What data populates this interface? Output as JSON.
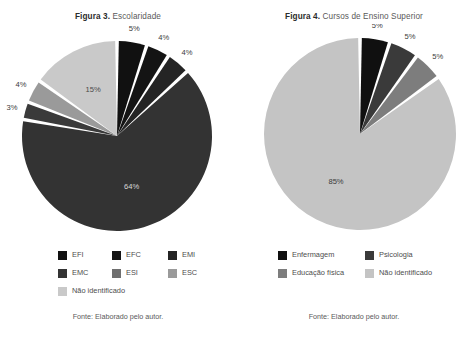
{
  "figures": [
    {
      "title_label": "Figura 3.",
      "title_text": " Escolaridade",
      "source": "Fonte: Elaborado pelo autor.",
      "chart_data": {
        "type": "pie",
        "title": "Figura 3. Escolaridade",
        "legend_position": "bottom",
        "start_angle_deg": 0,
        "direction": "clockwise",
        "categories": [
          "EFI",
          "EFC",
          "EMI",
          "EMC",
          "ESI",
          "ESC",
          "Não identificado"
        ],
        "values": [
          5,
          4,
          4,
          64,
          3,
          4,
          15
        ],
        "labels": [
          "5%",
          "4%",
          "4%",
          "64%",
          "3%",
          "4%",
          "15%"
        ],
        "colors": [
          "#111111",
          "#141414",
          "#242424",
          "#333333",
          "#3a3a3a",
          "#9a9a9a",
          "#c9c9c9"
        ],
        "label_colors": [
          "#3b3b3b",
          "#3b3b3b",
          "#3b3b3b",
          "#d8d8d8",
          "#3b3b3b",
          "#3b3b3b",
          "#4a4a4a"
        ],
        "label_inside": [
          false,
          false,
          false,
          true,
          false,
          false,
          true
        ]
      },
      "legend_rows": [
        [
          {
            "label": "EFI",
            "color": "#111111"
          },
          {
            "label": "EFC",
            "color": "#141414"
          },
          {
            "label": "EMI",
            "color": "#242424"
          }
        ],
        [
          {
            "label": "EMC",
            "color": "#333333"
          },
          {
            "label": "ESI",
            "color": "#6f6f6f"
          },
          {
            "label": "ESC",
            "color": "#9a9a9a"
          }
        ],
        [
          {
            "label": "Não identificado",
            "color": "#c9c9c9"
          }
        ]
      ],
      "legend_columns_x": [
        58,
        112,
        168
      ],
      "legend_top": 246,
      "source_top": 312,
      "pie": {
        "cx": 117,
        "cy": 112,
        "r": 95,
        "gap_deg": 2.2
      }
    },
    {
      "title_label": "Figura 4.",
      "title_text": " Cursos de Ensino Superior",
      "source": "Fonte: Elaborado pelo autor.",
      "chart_data": {
        "type": "pie",
        "title": "Figura 4. Cursos de Ensino Superior",
        "legend_position": "bottom",
        "start_angle_deg": 0,
        "direction": "clockwise",
        "categories": [
          "Enfermagem",
          "Psicologia",
          "Educação física",
          "Não identificado"
        ],
        "values": [
          5,
          5,
          5,
          85
        ],
        "labels": [
          "5%",
          "5%",
          "5%",
          "85%"
        ],
        "colors": [
          "#101010",
          "#3a3a3a",
          "#7d7d7d",
          "#c4c4c4"
        ],
        "label_colors": [
          "#3b3b3b",
          "#3b3b3b",
          "#3b3b3b",
          "#3b3b3b"
        ],
        "label_inside": [
          false,
          false,
          false,
          true
        ]
      },
      "legend_rows": [
        [
          {
            "label": "Enfermagem",
            "color": "#101010"
          },
          {
            "label": "Psicologia",
            "color": "#3a3a3a"
          }
        ],
        [
          {
            "label": "Educação física",
            "color": "#7d7d7d"
          },
          {
            "label": "Não identificado",
            "color": "#c4c4c4"
          }
        ]
      ],
      "legend_columns_x": [
        42,
        129
      ],
      "legend_top": 246,
      "source_top": 312,
      "pie": {
        "cx": 124,
        "cy": 110,
        "r": 96,
        "gap_deg": 2.2
      }
    }
  ]
}
